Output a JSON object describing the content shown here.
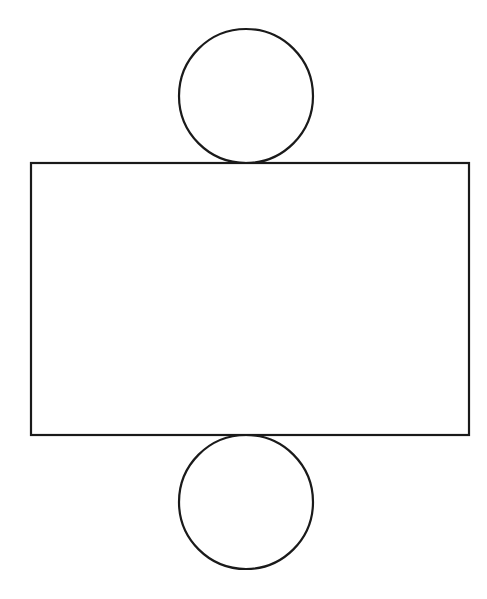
{
  "canvas": {
    "width": 487,
    "height": 599,
    "background_color": "#ffffff",
    "title": "Geometric line drawing"
  },
  "style": {
    "stroke_color": "#1a1a1a",
    "stroke_width": 2.2,
    "fill_color": "none"
  },
  "chart_data": {
    "type": "diagram",
    "title": "Rectangle with two tangent circles",
    "subtitle": "",
    "xlabel": "",
    "ylabel": "",
    "units": "pixels",
    "coordinate_origin": "top-left",
    "xlim": [
      0,
      487
    ],
    "ylim": [
      0,
      599
    ],
    "grid": false,
    "legend": false,
    "annotations": [],
    "shapes": [
      {
        "id": "top-circle",
        "kind": "circle",
        "label": "Upper circle",
        "cx": 246,
        "cy": 96,
        "r": 67,
        "left": 179,
        "right": 313,
        "top": 29,
        "bottom": 163,
        "stroke": "#1a1a1a",
        "stroke_width": 2.2,
        "fill": "none"
      },
      {
        "id": "main-rectangle",
        "kind": "rectangle",
        "label": "Central rectangle",
        "x": 31,
        "y": 163,
        "width": 438,
        "height": 272,
        "left": 31,
        "right": 469,
        "top": 163,
        "bottom": 435,
        "stroke": "#1a1a1a",
        "stroke_width": 2.2,
        "fill": "none"
      },
      {
        "id": "bottom-circle",
        "kind": "circle",
        "label": "Lower circle",
        "cx": 246,
        "cy": 502,
        "r": 67,
        "left": 179,
        "right": 313,
        "top": 435,
        "bottom": 569,
        "stroke": "#1a1a1a",
        "stroke_width": 2.2,
        "fill": "none"
      }
    ],
    "relations": [
      "Upper circle is tangent to the top edge of the rectangle",
      "Lower circle is tangent to the bottom edge of the rectangle",
      "Both circles share the same horizontal center as the rectangle"
    ]
  }
}
